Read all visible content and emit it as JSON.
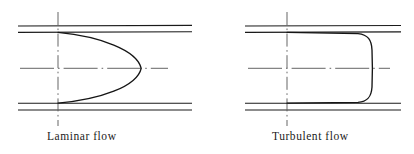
{
  "figure": {
    "title": "",
    "background_color": "#ffffff",
    "line_color": "#1a1a1a",
    "centerline_color": "#6e6e6e",
    "width": 414,
    "height": 154
  },
  "panels": [
    {
      "id": "laminar",
      "caption": "Laminar flow",
      "profile_type": "parabolic",
      "pipe": {
        "wall_top_outer_y": 26,
        "wall_top_inner_y": 32,
        "wall_bottom_inner_y": 103,
        "wall_bottom_outer_y": 110,
        "wall_x_start": 18,
        "wall_x_end": 192
      },
      "axis": {
        "vertical_x": 58,
        "vertical_y_start": 12,
        "vertical_y_end": 126,
        "horizontal_y": 68,
        "horizontal_x_start": 20,
        "horizontal_x_end": 168
      },
      "profile": {
        "base_x": 58,
        "apex_x": 141,
        "apex_y": 68,
        "top_y": 32,
        "bottom_y": 103
      }
    },
    {
      "id": "turbulent",
      "caption": "Turbulent flow",
      "profile_type": "flat-top-with-rounded-corners",
      "pipe": {
        "wall_top_outer_y": 26,
        "wall_top_inner_y": 32,
        "wall_bottom_inner_y": 103,
        "wall_bottom_outer_y": 110,
        "wall_x_start": 245,
        "wall_x_end": 401
      },
      "axis": {
        "vertical_x": 287,
        "vertical_y_start": 12,
        "vertical_y_end": 126,
        "horizontal_y": 68,
        "horizontal_x_start": 248,
        "horizontal_x_end": 390
      },
      "profile": {
        "base_x": 287,
        "plateau_x": 372,
        "top_y": 32,
        "bottom_y": 103,
        "corner_radius": 14
      }
    }
  ],
  "labels": {
    "laminar": "Laminar flow",
    "turbulent": "Turbulent flow"
  }
}
